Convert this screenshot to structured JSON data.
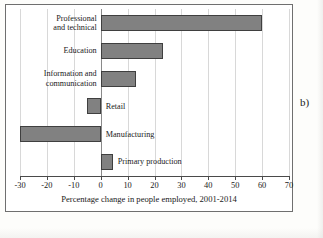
{
  "panel": {
    "label": "b)",
    "title_remnant": ""
  },
  "chart_data": {
    "type": "bar",
    "orientation": "horizontal",
    "title": "",
    "xlabel": "Percentage change in people employed, 2001-2014",
    "ylabel": "",
    "xlim": [
      -30,
      70
    ],
    "xticks": [
      -30,
      -20,
      -10,
      0,
      10,
      20,
      30,
      40,
      50,
      60,
      70
    ],
    "xtick_labels": [
      "-30",
      "-20",
      "-10",
      "0",
      "10",
      "20",
      "30",
      "40",
      "50",
      "60",
      "70"
    ],
    "grid": true,
    "grid_axis": "x",
    "legend": null,
    "bar_color": "#818181",
    "bar_edge_color": "#3f3f3f",
    "categories": [
      "Professional and technical",
      "Education",
      "Information and communication",
      "Retail",
      "Manufacturing",
      "Primary production"
    ],
    "category_label_lines": [
      [
        "Professional",
        "and technical"
      ],
      [
        "Education"
      ],
      [
        "Information and",
        "communication"
      ],
      [
        "Retail"
      ],
      [
        "Manufacturing"
      ],
      [
        "Primary production"
      ]
    ],
    "values": [
      60,
      23,
      13,
      -5,
      -30,
      4.5
    ]
  }
}
